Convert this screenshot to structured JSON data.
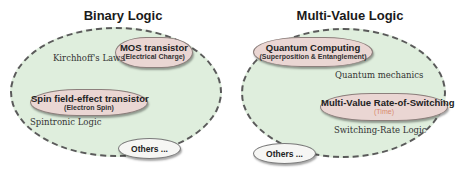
{
  "left": {
    "title": "Binary Logic",
    "clouds": [
      {
        "main": "MOS transistor",
        "sub": "(Electrical Charge)",
        "label": "Kirchhoff's Laws"
      },
      {
        "main": "Spin field-effect transistor",
        "sub": "(Electron Spin)",
        "label": "Spintronic Logic"
      }
    ],
    "others": "Others ..."
  },
  "right": {
    "title": "Multi-Value Logic",
    "clouds": [
      {
        "main": "Quantum  Computing",
        "sub": "(Superposition & Entanglement)",
        "label": "Quantum mechanics"
      },
      {
        "main": "Multi-Value Rate-of-Switching",
        "sub": "(Time)",
        "label": "Switching-Rate Logic"
      }
    ],
    "others": "Others ..."
  },
  "colors": {
    "ellipse_fill": "#dfeedd",
    "cloud_fill": "#ead6d3",
    "time_accent": "#d98a6e"
  }
}
